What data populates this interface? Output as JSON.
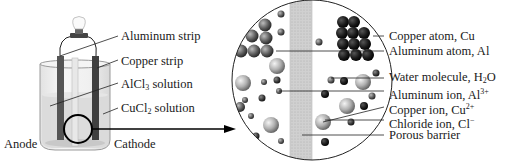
{
  "diagram": {
    "beaker": {
      "labels": {
        "aluminum_strip": "Aluminum strip",
        "copper_strip": "Copper strip",
        "alcl3_main": "AlCl",
        "alcl3_sub": "3",
        "alcl3_tail": " solution",
        "cucl2_main": "CuCl",
        "cucl2_sub": "2",
        "cucl2_tail": " solution",
        "anode": "Anode",
        "cathode": "Cathode"
      }
    },
    "magnified_view": {
      "labels": {
        "copper_atom": "Copper atom, Cu",
        "aluminum_atom": "Aluminum atom, Al",
        "water_main": "Water molecule, H",
        "water_sub": "2",
        "water_tail": "O",
        "aluminum_ion_main": "Aluminum ion, Al",
        "aluminum_ion_sup": "3+",
        "copper_ion_main": "Copper ion, Cu",
        "copper_ion_sup": "2+",
        "chloride_ion_main": "Chloride ion, Cl",
        "chloride_ion_sup": "−",
        "porous_barrier": "Porous barrier"
      }
    },
    "colors": {
      "line": "#1a1a1a",
      "barrier": "#cfcfcf",
      "solution": "#d6d6d6",
      "electrode": "#4a4a4a"
    }
  }
}
